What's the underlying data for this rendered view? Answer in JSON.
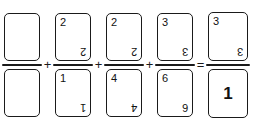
{
  "figure": {
    "ink_color": "#1a1a1a",
    "background_color": "#ffffff"
  },
  "equation": {
    "terms": [
      {
        "name": "term-1",
        "numerator": {
          "value": "",
          "blank": true
        },
        "denominator": {
          "value": "",
          "blank": true
        },
        "operator_after": "+"
      },
      {
        "name": "term-2",
        "numerator": {
          "value": "2",
          "blank": false
        },
        "denominator": {
          "value": "1",
          "blank": false
        },
        "operator_after": "+"
      },
      {
        "name": "term-3",
        "numerator": {
          "value": "2",
          "blank": false
        },
        "denominator": {
          "value": "4",
          "blank": false
        },
        "operator_after": "+"
      },
      {
        "name": "term-4",
        "numerator": {
          "value": "3",
          "blank": false
        },
        "denominator": {
          "value": "6",
          "blank": false
        },
        "operator_after": "="
      },
      {
        "name": "term-5-result",
        "numerator": {
          "value": "3",
          "blank": false
        },
        "denominator": {
          "value": "1",
          "blank": false,
          "centered": true
        },
        "operator_after": ""
      }
    ],
    "operators": [
      "+",
      "+",
      "+",
      "="
    ]
  }
}
